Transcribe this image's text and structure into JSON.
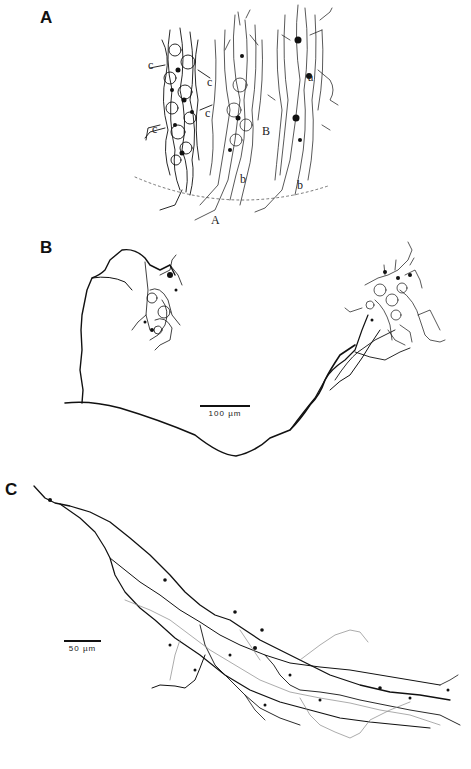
{
  "figure": {
    "panels": [
      {
        "label": "A",
        "description": "Golgi-style drawing of three vertical dendritic/axonal columns",
        "annotations": [
          "c",
          "c",
          "c",
          "c",
          "B",
          "b",
          "b",
          "a",
          "A"
        ]
      },
      {
        "label": "B",
        "description": "Reconstructed axon with two terminal arbor clusters",
        "scale_bar": "100 µm"
      },
      {
        "label": "C",
        "description": "Reconstructed elongated axonal arborization, black and gray traces",
        "scale_bar": "50 µm"
      }
    ]
  }
}
